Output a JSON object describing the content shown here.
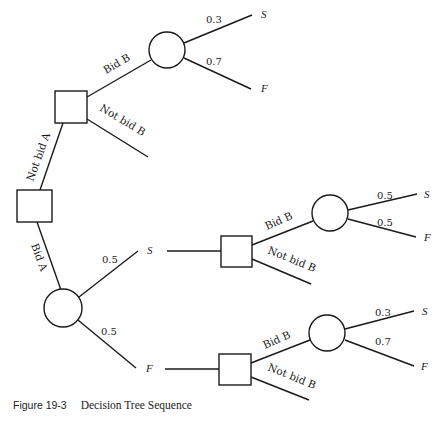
{
  "diagram": {
    "type": "decision-tree",
    "nodes": {
      "root_decision": {
        "kind": "decision"
      },
      "not_bid_a_decision": {
        "kind": "decision"
      },
      "bid_b_chance_top": {
        "kind": "chance"
      },
      "bid_a_chance": {
        "kind": "chance"
      },
      "after_success_decision": {
        "kind": "decision"
      },
      "after_failure_decision": {
        "kind": "decision"
      },
      "bid_b_chance_after_success": {
        "kind": "chance"
      },
      "bid_b_chance_after_failure": {
        "kind": "chance"
      }
    },
    "labels": {
      "not_bid_a": "Not bid A",
      "bid_a": "Bid A",
      "top_bid_b": "Bid B",
      "top_not_bid_b": "Not bid B",
      "top_prob_s": "0.3",
      "top_prob_f": "0.7",
      "top_term_s": "S",
      "top_term_f": "F",
      "a_prob_s": "0.5",
      "a_prob_f": "0.5",
      "a_outcome_s": "S",
      "a_outcome_f": "F",
      "mid_bid_b": "Bid B",
      "mid_not_bid_b": "Not bid B",
      "mid_prob_s": "0.5",
      "mid_prob_f": "0.5",
      "mid_term_s": "S",
      "mid_term_f": "F",
      "bot_bid_b": "Bid B",
      "bot_not_bid_b": "Not bid B",
      "bot_prob_s": "0.3",
      "bot_prob_f": "0.7",
      "bot_term_s": "S",
      "bot_term_f": "F"
    }
  },
  "caption": {
    "number": "Figure 19-3",
    "title": "Decision Tree Sequence"
  }
}
